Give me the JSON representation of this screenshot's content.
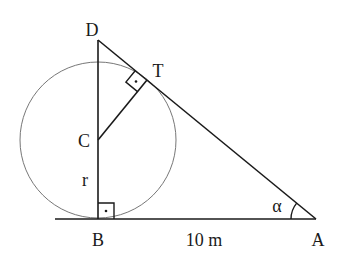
{
  "diagram": {
    "points": {
      "D": {
        "label": "D",
        "x": 98,
        "y": 40
      },
      "T": {
        "label": "T",
        "x": 147,
        "y": 80
      },
      "C": {
        "label": "C",
        "x": 98,
        "y": 140
      },
      "B": {
        "label": "B",
        "x": 98,
        "y": 219
      },
      "A": {
        "label": "A",
        "x": 316,
        "y": 219
      }
    },
    "labels": {
      "D": "D",
      "T": "T",
      "C": "C",
      "B": "B",
      "A": "A",
      "radius": "r",
      "distance_BA": "10 m",
      "angle_A": "α"
    },
    "circle": {
      "cx": 98,
      "cy": 140,
      "r": 78
    },
    "right_angles": [
      "B",
      "T"
    ],
    "colors": {
      "stroke": "#1a1a1a",
      "circle": "#777777",
      "background": "#ffffff"
    }
  }
}
